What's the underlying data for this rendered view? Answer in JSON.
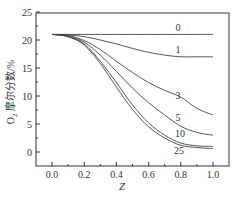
{
  "chart_data": {
    "type": "line",
    "title": "",
    "xlabel": "Z",
    "ylabel": "O₂ 摩尔分数/%",
    "xlim": [
      -0.1,
      1.1
    ],
    "ylim": [
      -2.5,
      25
    ],
    "xticks": [
      0.0,
      0.2,
      0.4,
      0.6,
      0.8,
      1.0
    ],
    "xtick_labels": [
      "0.0",
      "0.2",
      "0.4",
      "0.6",
      "0.8",
      "1.0"
    ],
    "yticks": [
      0,
      5,
      10,
      15,
      20,
      25
    ],
    "ytick_labels": [
      "0",
      "5",
      "10",
      "15",
      "20",
      "25"
    ],
    "grid": false,
    "legend": "inline curve labels",
    "x": [
      0.0,
      0.1,
      0.2,
      0.3,
      0.4,
      0.5,
      0.6,
      0.7,
      0.8,
      0.9,
      1.0
    ],
    "series": [
      {
        "name": "0",
        "values": [
          21.0,
          21.0,
          21.0,
          21.0,
          21.0,
          21.0,
          21.0,
          21.0,
          21.0,
          21.0,
          21.0
        ]
      },
      {
        "name": "1",
        "values": [
          21.0,
          20.9,
          20.6,
          20.0,
          19.3,
          18.5,
          17.8,
          17.3,
          17.0,
          17.0,
          17.0
        ]
      },
      {
        "name": "3",
        "values": [
          21.0,
          20.8,
          19.9,
          18.3,
          16.2,
          14.2,
          12.4,
          11.0,
          9.8,
          7.8,
          6.6
        ]
      },
      {
        "name": "5",
        "values": [
          21.0,
          20.7,
          19.6,
          17.3,
          14.4,
          11.4,
          8.8,
          6.6,
          4.6,
          3.5,
          3.0
        ]
      },
      {
        "name": "10",
        "values": [
          21.0,
          20.6,
          19.3,
          16.2,
          12.4,
          8.4,
          5.2,
          3.0,
          1.6,
          1.1,
          1.0
        ]
      },
      {
        "name": "25",
        "values": [
          21.0,
          20.6,
          19.1,
          15.8,
          11.6,
          7.6,
          4.5,
          2.5,
          1.2,
          0.8,
          0.6
        ]
      }
    ]
  },
  "labels": {
    "xlabel": "Z",
    "ylabel_prefix": "O",
    "ylabel_sub": "2",
    "ylabel_rest": " 摩尔分数/%",
    "curve_labels": [
      "0",
      "1",
      "3",
      "5",
      "10",
      "25"
    ]
  }
}
